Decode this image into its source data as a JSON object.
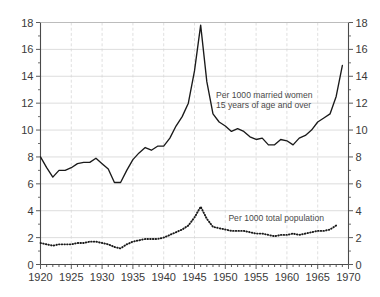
{
  "chart_data": {
    "type": "line",
    "title": "",
    "subtitle": "",
    "xlabel": "",
    "ylabel": "",
    "xlim": [
      1920,
      1970
    ],
    "ylim": [
      0,
      18
    ],
    "ytick_step": 2,
    "xtick_step": 5,
    "x_minor_step": 1,
    "grid": true,
    "grid_color": "#cfcfcf",
    "axis_color": "#4a4a4a",
    "line_color": "#1a1a1a",
    "background": "#ffffff",
    "legend_position": "inline-annotation",
    "y_axis_both_sides": true,
    "yticks": [
      0,
      2,
      4,
      6,
      8,
      10,
      12,
      14,
      16,
      18
    ],
    "xticks": [
      1920,
      1925,
      1930,
      1935,
      1940,
      1945,
      1950,
      1955,
      1960,
      1965,
      1970
    ],
    "xtick_labels": [
      "1920",
      "1925",
      "1930",
      "1935",
      "1940",
      "1945",
      "1950",
      "1955",
      "1960",
      "1965",
      "1970"
    ],
    "ytick_labels_left": [
      "0",
      "2",
      "4",
      "6",
      "8",
      "10",
      "12",
      "14",
      "16",
      "18"
    ],
    "ytick_labels_right": [
      "0",
      "2",
      "4",
      "6",
      "8",
      "10",
      "12",
      "14",
      "16",
      "18"
    ],
    "annotations": [
      {
        "name": "married-women-label",
        "lines": [
          "Per 1000 married women",
          "15 years of age and over"
        ],
        "x": 1948.5,
        "y": 12.4
      },
      {
        "name": "total-population-label",
        "lines": [
          "Per 1000 total population"
        ],
        "x": 1950.5,
        "y": 3.2
      }
    ],
    "series": [
      {
        "name": "Per 1000 married women 15 years of age and over",
        "style": "solid",
        "x": [
          1920,
          1921,
          1922,
          1923,
          1924,
          1925,
          1926,
          1927,
          1928,
          1929,
          1930,
          1931,
          1932,
          1933,
          1934,
          1935,
          1936,
          1937,
          1938,
          1939,
          1940,
          1941,
          1942,
          1943,
          1944,
          1945,
          1946,
          1947,
          1948,
          1949,
          1950,
          1951,
          1952,
          1953,
          1954,
          1955,
          1956,
          1957,
          1958,
          1959,
          1960,
          1961,
          1962,
          1963,
          1964,
          1965,
          1966,
          1967,
          1968,
          1969
        ],
        "values": [
          8.0,
          7.2,
          6.5,
          7.0,
          7.0,
          7.2,
          7.5,
          7.6,
          7.6,
          7.9,
          7.5,
          7.1,
          6.1,
          6.1,
          7.0,
          7.8,
          8.3,
          8.7,
          8.5,
          8.8,
          8.8,
          9.4,
          10.3,
          11.0,
          12.0,
          14.4,
          17.8,
          13.6,
          11.2,
          10.6,
          10.3,
          9.9,
          10.1,
          9.9,
          9.5,
          9.3,
          9.4,
          8.9,
          8.9,
          9.3,
          9.2,
          8.9,
          9.4,
          9.6,
          10.0,
          10.6,
          10.9,
          11.2,
          12.5,
          14.8
        ]
      },
      {
        "name": "Per 1000 total population",
        "style": "dotted",
        "x": [
          1920,
          1921,
          1922,
          1923,
          1924,
          1925,
          1926,
          1927,
          1928,
          1929,
          1930,
          1931,
          1932,
          1933,
          1934,
          1935,
          1936,
          1937,
          1938,
          1939,
          1940,
          1941,
          1942,
          1943,
          1944,
          1945,
          1946,
          1947,
          1948,
          1949,
          1950,
          1951,
          1952,
          1953,
          1954,
          1955,
          1956,
          1957,
          1958,
          1959,
          1960,
          1961,
          1962,
          1963,
          1964,
          1965,
          1966,
          1967,
          1968
        ],
        "values": [
          1.6,
          1.5,
          1.4,
          1.5,
          1.5,
          1.5,
          1.6,
          1.6,
          1.7,
          1.7,
          1.6,
          1.5,
          1.3,
          1.2,
          1.5,
          1.7,
          1.8,
          1.9,
          1.9,
          1.9,
          2.0,
          2.2,
          2.4,
          2.6,
          2.9,
          3.5,
          4.3,
          3.4,
          2.8,
          2.7,
          2.6,
          2.5,
          2.5,
          2.5,
          2.4,
          2.3,
          2.3,
          2.2,
          2.1,
          2.2,
          2.2,
          2.3,
          2.2,
          2.3,
          2.4,
          2.5,
          2.5,
          2.6,
          2.9
        ]
      }
    ]
  }
}
